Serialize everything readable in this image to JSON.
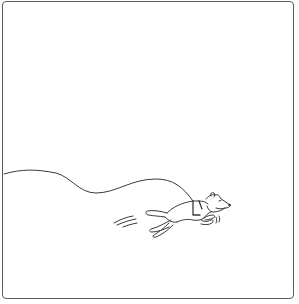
{
  "panel": {
    "description": "Single-panel line drawing: a dog running to the right on a long, curving leash trailing off the left edge",
    "stroke_color": "#3a3a3a",
    "border_color": "#5a5a5a",
    "background": "#ffffff"
  },
  "elements": {
    "leash": "leash-line",
    "dog": "running-dog",
    "harness": "dog-harness",
    "motion_lines_tail": "speed-lines",
    "motion_lines_face": "breath-lines"
  }
}
